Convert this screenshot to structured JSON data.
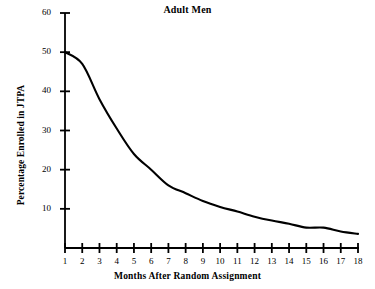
{
  "chart_data": {
    "type": "line",
    "title": "Adult Men",
    "xlabel": "Months After Random Assignment",
    "ylabel": "Percentage Enrolled in JTPA",
    "x": [
      1,
      2,
      3,
      4,
      5,
      6,
      7,
      8,
      9,
      10,
      11,
      12,
      13,
      14,
      15,
      16,
      17,
      18
    ],
    "values": [
      50,
      47,
      38,
      30.5,
      24,
      20,
      16,
      14,
      12,
      10.5,
      9.3,
      8,
      7,
      6.2,
      5.2,
      5.2,
      4.2,
      3.6
    ],
    "series": [
      {
        "name": "Adult Men",
        "values": [
          50,
          47,
          38,
          30.5,
          24,
          20,
          16,
          14,
          12,
          10.5,
          9.3,
          8,
          7,
          6.2,
          5.2,
          5.2,
          4.2,
          3.6
        ]
      }
    ],
    "xticklabels": [
      "1",
      "2",
      "3",
      "4",
      "5",
      "6",
      "7",
      "8",
      "9",
      "10",
      "11",
      "12",
      "13",
      "14",
      "15",
      "16",
      "17",
      "18"
    ],
    "yticklabels": [
      "10",
      "20",
      "30",
      "40",
      "50",
      "60"
    ],
    "yticks": [
      10,
      20,
      30,
      40,
      50,
      60
    ],
    "xlim": [
      1,
      18
    ],
    "ylim": [
      0,
      60
    ],
    "grid": false,
    "legend": false,
    "line_color": "#000000",
    "background_color": "#ffffff"
  }
}
